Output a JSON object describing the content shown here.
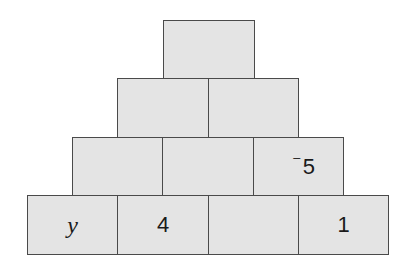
{
  "diagram": {
    "type": "number-pyramid",
    "rows": [
      {
        "row": 1,
        "bricks": [
          {
            "label": "",
            "x": 163,
            "y": 20,
            "w": 92,
            "h": 59
          }
        ]
      },
      {
        "row": 2,
        "bricks": [
          {
            "label": "",
            "x": 117,
            "y": 78,
            "w": 92,
            "h": 59
          },
          {
            "label": "",
            "x": 208,
            "y": 78,
            "w": 91,
            "h": 59
          }
        ]
      },
      {
        "row": 3,
        "bricks": [
          {
            "label": "",
            "x": 72,
            "y": 137,
            "w": 91,
            "h": 59
          },
          {
            "label": "",
            "x": 162,
            "y": 137,
            "w": 92,
            "h": 59
          },
          {
            "label": "5",
            "sign": "⁻",
            "x": 253,
            "y": 137,
            "w": 91,
            "h": 59
          }
        ]
      },
      {
        "row": 4,
        "bricks": [
          {
            "label": "y",
            "italic": true,
            "x": 27,
            "y": 195,
            "w": 91,
            "h": 60
          },
          {
            "label": "4",
            "x": 117,
            "y": 195,
            "w": 92,
            "h": 60
          },
          {
            "label": "",
            "x": 208,
            "y": 195,
            "w": 91,
            "h": 60
          },
          {
            "label": "1",
            "x": 298,
            "y": 195,
            "w": 91,
            "h": 60
          }
        ]
      }
    ],
    "colors": {
      "fill": "#e4e4e4",
      "border": "#4a4a4a",
      "text": "#1a1a1a"
    }
  }
}
